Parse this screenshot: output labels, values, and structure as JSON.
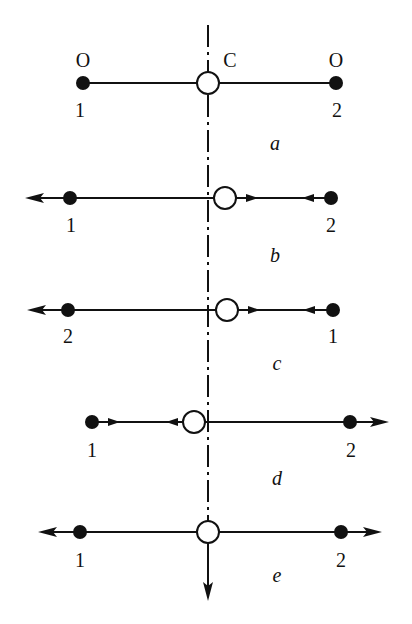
{
  "figure": {
    "axis": {
      "x": 208,
      "y_start": 25,
      "y_end": 600
    },
    "panels": [
      {
        "id": "a",
        "caption": "a",
        "y": 83,
        "left_dot": {
          "x": 83,
          "label": "1",
          "top_label": "O"
        },
        "right_dot": {
          "x": 336,
          "label": "2",
          "top_label": "O"
        },
        "center": {
          "x": 208,
          "label": "C"
        },
        "arrows": []
      },
      {
        "id": "b",
        "caption": "b",
        "y": 198,
        "left_dot": {
          "x": 70,
          "label": "1"
        },
        "right_dot": {
          "x": 331,
          "label": "2"
        },
        "center": {
          "x": 225
        },
        "arrows": [
          "left-outward",
          "center-right",
          "right-inward"
        ]
      },
      {
        "id": "c",
        "caption": "c",
        "y": 310,
        "left_dot": {
          "x": 68,
          "label": "2"
        },
        "right_dot": {
          "x": 333,
          "label": "1"
        },
        "center": {
          "x": 227
        },
        "arrows": [
          "left-outward",
          "center-right",
          "right-inward"
        ]
      },
      {
        "id": "d",
        "caption": "d",
        "y": 422,
        "left_dot": {
          "x": 92,
          "label": "1"
        },
        "right_dot": {
          "x": 350,
          "label": "2"
        },
        "center": {
          "x": 194
        },
        "arrows": [
          "left-inward",
          "center-left",
          "right-outward"
        ]
      },
      {
        "id": "e",
        "caption": "e",
        "y": 532,
        "left_dot": {
          "x": 80,
          "label": "1"
        },
        "right_dot": {
          "x": 341,
          "label": "2"
        },
        "center": {
          "x": 208
        },
        "arrows": [
          "left-outward",
          "right-outward",
          "center-down"
        ]
      }
    ]
  }
}
